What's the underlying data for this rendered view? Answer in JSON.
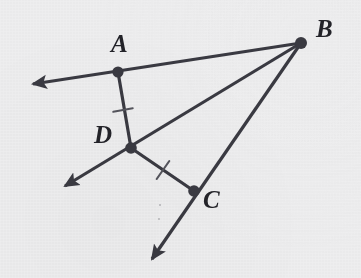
{
  "figure": {
    "kind": "geometry-diagram",
    "width": 361,
    "height": 278,
    "background_color": "#eeeeef",
    "stroke_color": "#3a3a42",
    "label_color": "#232329",
    "stroke_width": 3.2,
    "vertex_dot_radius": 5.6,
    "top_clipped_text": "",
    "points": [
      {
        "id": "A",
        "label": "A",
        "x": 118,
        "y": 72,
        "label_x": 111,
        "label_y": 31
      },
      {
        "id": "B",
        "label": "B",
        "x": 301,
        "y": 43,
        "label_x": 316,
        "label_y": 16
      },
      {
        "id": "C",
        "label": "C",
        "x": 194,
        "y": 191,
        "label_x": 203,
        "label_y": 187
      },
      {
        "id": "D",
        "label": "D",
        "x": 131,
        "y": 148,
        "label_x": 94,
        "label_y": 122
      }
    ],
    "rays": [
      {
        "id": "ray-BA",
        "from": "B",
        "through": "A",
        "tip_x": 33,
        "tip_y": 84,
        "arrow": true
      },
      {
        "id": "ray-BD",
        "from": "B",
        "through": "D",
        "tip_x": 65,
        "tip_y": 186,
        "arrow": true
      },
      {
        "id": "ray-BC",
        "from": "B",
        "through": "C",
        "tip_x": 152,
        "tip_y": 259,
        "arrow": true
      }
    ],
    "segments": [
      {
        "id": "segment-AD",
        "from": "A",
        "to": "D",
        "x1": 118,
        "y1": 72,
        "x2": 131,
        "y2": 148
      },
      {
        "id": "segment-DC",
        "from": "D",
        "to": "C",
        "x1": 131,
        "y1": 148,
        "x2": 194,
        "y2": 191
      }
    ],
    "tick_marks": [
      {
        "id": "tick-AD",
        "on": "segment-AD",
        "cx": 123,
        "cy": 110,
        "angle_deg": 100,
        "length": 20,
        "count": 1
      },
      {
        "id": "tick-DC",
        "on": "segment-DC",
        "cx": 163,
        "cy": 170,
        "angle_deg": 125,
        "length": 22,
        "count": 1
      }
    ],
    "speck_artifacts": [
      {
        "cx": 160,
        "cy": 205
      },
      {
        "cx": 159,
        "cy": 219
      }
    ]
  }
}
